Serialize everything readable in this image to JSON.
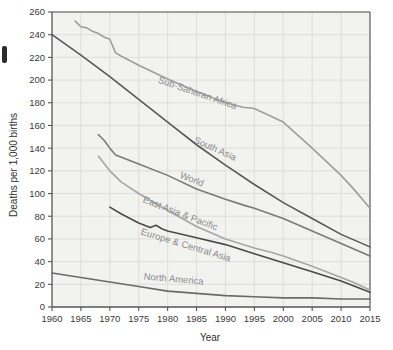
{
  "chart_data": {
    "type": "line",
    "title": "",
    "xlabel": "Year",
    "ylabel": "Deaths per 1,000 births",
    "xlim": [
      1960,
      2015
    ],
    "ylim": [
      0,
      260
    ],
    "xticks": [
      1960,
      1965,
      1970,
      1975,
      1980,
      1985,
      1990,
      1995,
      2000,
      2005,
      2010,
      2015
    ],
    "yticks": [
      0,
      20,
      40,
      60,
      80,
      100,
      120,
      140,
      160,
      180,
      200,
      220,
      240,
      260
    ],
    "grid": true,
    "legend_position": "inline-labels",
    "series": [
      {
        "name": "Sub-Saharan Africa",
        "color": "#9e9e9e",
        "label_x": 1985,
        "label_y": 186,
        "label_rotation": 19,
        "x": [
          1964,
          1965,
          1966,
          1967,
          1968,
          1969,
          1970,
          1971,
          1972,
          1975,
          1980,
          1985,
          1990,
          1993,
          1995,
          2000,
          2005,
          2010,
          2012,
          2015
        ],
        "y": [
          252,
          247,
          246,
          243,
          241,
          238,
          236,
          224,
          221,
          213,
          201,
          190,
          180,
          176,
          175,
          163,
          140,
          116,
          105,
          87
        ]
      },
      {
        "name": "South Asia",
        "color": "#585858",
        "label_x": 1988,
        "label_y": 137,
        "label_rotation": 24,
        "x": [
          1960,
          1965,
          1970,
          1975,
          1980,
          1985,
          1990,
          1995,
          2000,
          2005,
          2010,
          2015
        ],
        "y": [
          240,
          222,
          203,
          183,
          163,
          143,
          125,
          108,
          92,
          78,
          64,
          53
        ]
      },
      {
        "name": "World",
        "color": "#7a7a7a",
        "label_x": 1984,
        "label_y": 110,
        "label_rotation": 22,
        "x": [
          1968,
          1969,
          1970,
          1971,
          1975,
          1980,
          1985,
          1990,
          1993,
          1995,
          2000,
          2005,
          2010,
          2015
        ],
        "y": [
          152,
          147,
          140,
          134,
          126,
          116,
          104,
          95,
          90,
          87,
          78,
          67,
          56,
          45
        ]
      },
      {
        "name": "East Asia & Pacific",
        "color": "#a6a6a6",
        "label_x": 1982,
        "label_y": 80,
        "label_rotation": 21,
        "x": [
          1968,
          1970,
          1972,
          1975,
          1980,
          1985,
          1990,
          1995,
          1998,
          2000,
          2005,
          2010,
          2012,
          2015
        ],
        "y": [
          133,
          120,
          110,
          100,
          85,
          71,
          60,
          52,
          48,
          45,
          36,
          26,
          22,
          15
        ]
      },
      {
        "name": "Europe & Central Asia",
        "color": "#4a4a4a",
        "label_x": 1983,
        "label_y": 52,
        "label_rotation": 17,
        "x": [
          1970,
          1972,
          1975,
          1977,
          1978,
          1979,
          1980,
          1985,
          1990,
          1995,
          2000,
          2005,
          2010,
          2013,
          2015
        ],
        "y": [
          88,
          82,
          74,
          70,
          72,
          69,
          67,
          61,
          55,
          47,
          39,
          31,
          23,
          17,
          13
        ]
      },
      {
        "name": "North America",
        "color": "#6a6a6a",
        "label_x": 1981,
        "label_y": 22,
        "label_rotation": 5,
        "x": [
          1960,
          1965,
          1970,
          1975,
          1980,
          1985,
          1990,
          1995,
          2000,
          2005,
          2010,
          2015
        ],
        "y": [
          30,
          26,
          22,
          18,
          14,
          12,
          10,
          9,
          8,
          8,
          7,
          7
        ]
      }
    ]
  },
  "axes": {
    "y_title": "Deaths per 1,000 births",
    "x_title": "Year"
  },
  "colors": {
    "plot_background": "#f2f2f0",
    "grid": "#d8d8d6",
    "axis": "#555555",
    "text": "#3a3a3a",
    "page_background": "#ffffff"
  }
}
